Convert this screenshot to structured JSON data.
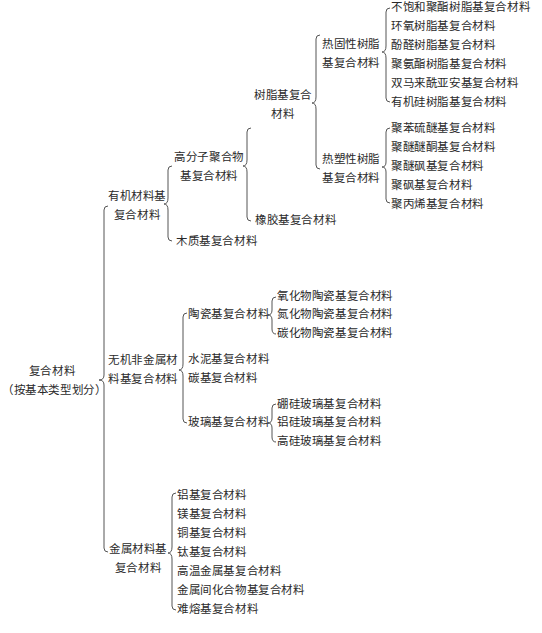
{
  "root": {
    "line1": "复合材料",
    "line2": "（按基本类型划分）"
  },
  "organic": {
    "line1": "有机材料基",
    "line2": "复合材料",
    "polymer": {
      "line1": "高分子聚合物",
      "line2": "基复合材料",
      "resin": {
        "line1": "树脂基复合",
        "line2": "材料",
        "thermoset": {
          "line1": "热固性树脂",
          "line2": "基复合材料",
          "items": [
            "不饱和聚酯树脂基复合材料",
            "环氧树脂基复合材料",
            "酚醛树脂基复合材料",
            "聚氨酯树脂基复合材料",
            "双马来酰亚安基复合材料",
            "有机硅树脂基复合材料"
          ]
        },
        "thermoplastic": {
          "line1": "热塑性树脂",
          "line2": "基复合材料",
          "items": [
            "聚苯硫醚基复合材料",
            "聚醚醚酮基复合材料",
            "聚醚砜基复合材料",
            "聚砜基复合材料",
            "聚丙烯基复合材料"
          ]
        }
      },
      "rubber": "橡胶基复合材料"
    },
    "wood": "木质基复合材料"
  },
  "inorganic": {
    "line1": "无机非金属材",
    "line2": "料基复合材料",
    "ceramic": {
      "label": "陶瓷基复合材料",
      "items": [
        "氧化物陶瓷基复合材料",
        "氮化物陶瓷基复合材料",
        "碳化物陶瓷基复合材料"
      ]
    },
    "cement": "水泥基复合材料",
    "carbon": "碳基复合材料",
    "glass": {
      "label": "玻璃基复合材料",
      "items": [
        "硼硅玻璃基复合材料",
        "铝硅玻璃基复合材料",
        "高硅玻璃基复合材料"
      ]
    }
  },
  "metal": {
    "line1": "金属材料基",
    "line2": "复合材料",
    "items": [
      "铝基复合材料",
      "镁基复合材料",
      "铜基复合材料",
      "钛基复合材料",
      "高温金属基复合材料",
      "金属间化合物基复合材料",
      "难熔基复合材料"
    ]
  }
}
